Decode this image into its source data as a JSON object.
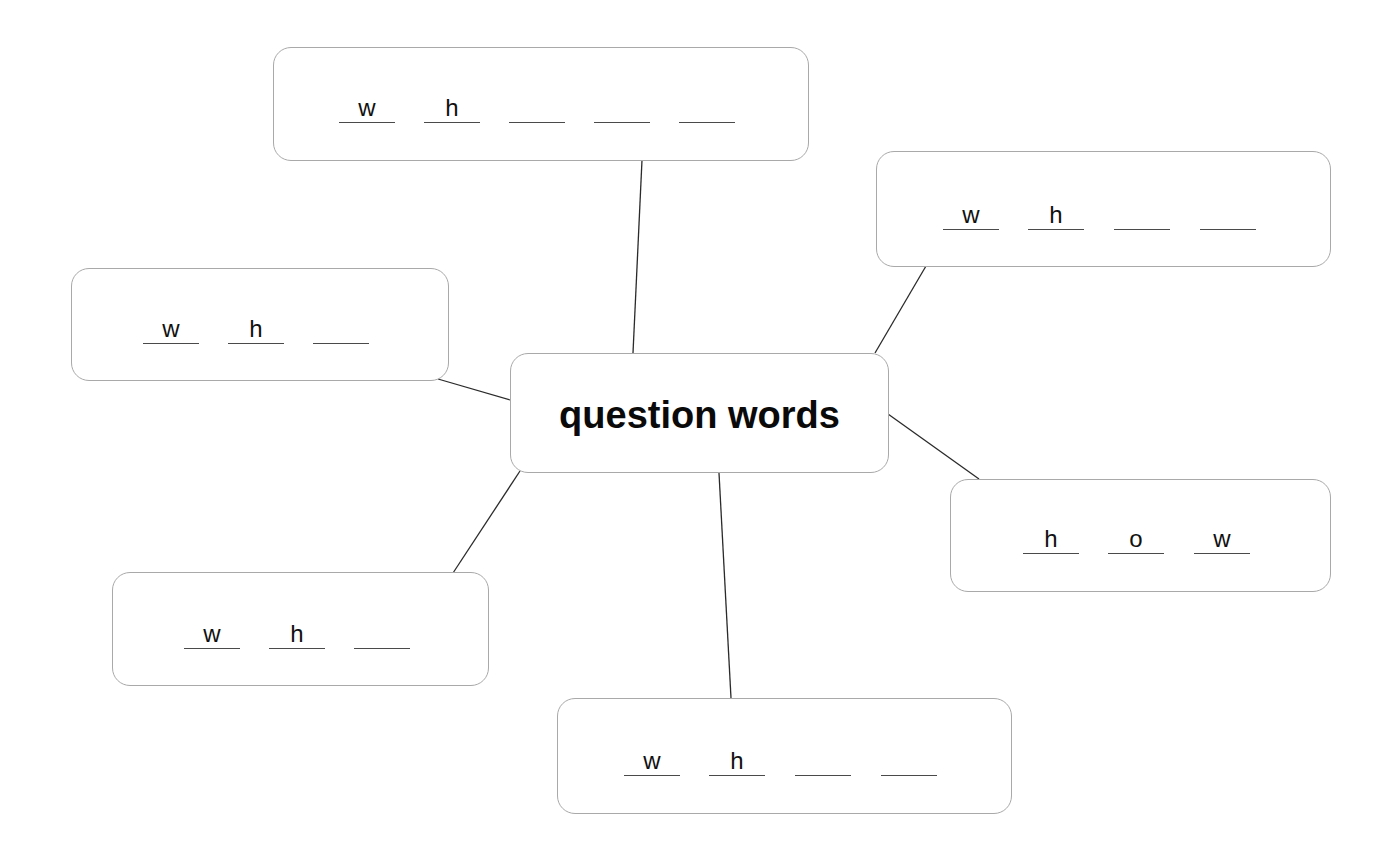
{
  "diagram": {
    "type": "mind-map",
    "center": {
      "title": "question words"
    },
    "branches": [
      {
        "id": "top",
        "letters": [
          "w",
          "h",
          "",
          "",
          ""
        ],
        "blank_count": 5
      },
      {
        "id": "top-right",
        "letters": [
          "w",
          "h",
          "",
          ""
        ],
        "blank_count": 4
      },
      {
        "id": "left",
        "letters": [
          "w",
          "h",
          ""
        ],
        "blank_count": 3
      },
      {
        "id": "right",
        "letters": [
          "h",
          "o",
          "w"
        ],
        "blank_count": 3
      },
      {
        "id": "bottom-left",
        "letters": [
          "w",
          "h",
          ""
        ],
        "blank_count": 3
      },
      {
        "id": "bottom",
        "letters": [
          "w",
          "h",
          "",
          ""
        ],
        "blank_count": 4
      }
    ]
  },
  "colors": {
    "box_border": "#a9a9a9",
    "connector": "#2a2a2a",
    "text": "#0a0a0a",
    "underline": "#4a4a4a"
  }
}
